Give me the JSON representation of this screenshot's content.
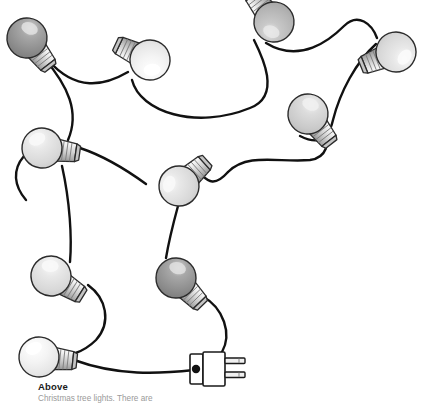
{
  "figure": {
    "name": "christmas-tree-lights-illustration",
    "background_color": "#ffffff",
    "wire_color": "#111111",
    "outline_color": "#2b2b2b"
  },
  "caption": {
    "title": "Above",
    "body": "Christmas tree lights. There are"
  },
  "plug": {
    "name": "electrical-plug",
    "prongs": 2,
    "body_color": "#ffffff",
    "outline_color": "#1a1a1a",
    "x": 196,
    "y": 368
  },
  "bulbs": [
    {
      "id": "bulb-1",
      "label": "Bulb 1",
      "shade": "dark",
      "glass_color": "#8e8e8e",
      "highlight_color": "#d8d8d8",
      "cx": 27,
      "cy": 38,
      "r": 20,
      "base_angle": 135
    },
    {
      "id": "bulb-2",
      "label": "Bulb 2",
      "shade": "very-light",
      "glass_color": "#ededed",
      "highlight_color": "#ffffff",
      "cx": 148,
      "cy": 60,
      "r": 20,
      "base_angle": 205
    },
    {
      "id": "bulb-3",
      "label": "Bulb 3",
      "shade": "medium",
      "glass_color": "#b9b9b9",
      "highlight_color": "#e6e6e6",
      "cx": 272,
      "cy": 21,
      "r": 20,
      "base_angle": 240
    },
    {
      "id": "bulb-4",
      "label": "Bulb 4",
      "shade": "light",
      "glass_color": "#e2e2e2",
      "highlight_color": "#ffffff",
      "cx": 394,
      "cy": 50,
      "r": 20,
      "base_angle": 160
    },
    {
      "id": "bulb-5",
      "label": "Bulb 5",
      "shade": "medium-light",
      "glass_color": "#cfcfcf",
      "highlight_color": "#efefef",
      "cx": 308,
      "cy": 113,
      "r": 20,
      "base_angle": 320
    },
    {
      "id": "bulb-6",
      "label": "Bulb 6",
      "shade": "light",
      "glass_color": "#d9d9d9",
      "highlight_color": "#f2f2f2",
      "cx": 42,
      "cy": 148,
      "r": 20,
      "base_angle": 10
    },
    {
      "id": "bulb-7",
      "label": "Bulb 7",
      "shade": "light",
      "glass_color": "#dcdcdc",
      "highlight_color": "#f4f4f4",
      "cx": 180,
      "cy": 184,
      "r": 20,
      "base_angle": 35
    },
    {
      "id": "bulb-8",
      "label": "Bulb 8",
      "shade": "light",
      "glass_color": "#dcdcdc",
      "highlight_color": "#f4f4f4",
      "cx": 51,
      "cy": 275,
      "r": 20,
      "base_angle": 330
    },
    {
      "id": "bulb-9",
      "label": "Bulb 9",
      "shade": "dark",
      "glass_color": "#909090",
      "highlight_color": "#d5d5d5",
      "cx": 176,
      "cy": 277,
      "r": 20,
      "base_angle": 320
    },
    {
      "id": "bulb-10",
      "label": "Bulb 10",
      "shade": "very-light",
      "glass_color": "#f2f2f2",
      "highlight_color": "#ffffff",
      "cx": 39,
      "cy": 356,
      "r": 20,
      "base_angle": 0
    }
  ]
}
